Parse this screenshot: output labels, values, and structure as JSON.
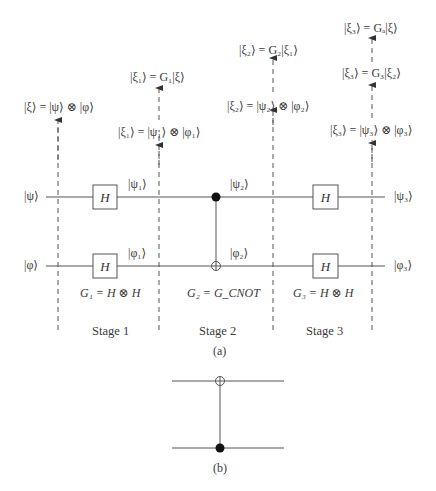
{
  "figure": {
    "part_a": {
      "caption": "(a)",
      "inputs": {
        "top": "|ψ⟩",
        "bottom": "|φ⟩"
      },
      "outputs": {
        "top": "|ψ₃⟩",
        "bottom": "|φ₃⟩"
      },
      "stages": [
        {
          "label": "Stage 1",
          "gate_formula": "G₁ = H ⊗ H",
          "gates": {
            "top": "H",
            "bottom": "H"
          },
          "wire_labels": {
            "top": "|ψ₁⟩",
            "bottom": "|φ₁⟩"
          }
        },
        {
          "label": "Stage 2",
          "gate_formula": "G₂ = G_CNOT",
          "gates": {
            "control": "top",
            "target": "bottom"
          },
          "wire_labels": {
            "top": "|ψ₂⟩",
            "bottom": "|φ₂⟩"
          }
        },
        {
          "label": "Stage 3",
          "gate_formula": "G₃ = H ⊗ H",
          "gates": {
            "top": "H",
            "bottom": "H"
          },
          "wire_labels": {
            "top": "|ψ₃⟩",
            "bottom": "|φ₃⟩"
          }
        }
      ],
      "state_annotations": {
        "stage0": [
          "|ξ⟩ = |ψ⟩ ⊗ |φ⟩"
        ],
        "stage1": [
          "|ξ₁⟩ = |ψ₁⟩ ⊗ |φ₁⟩",
          "|ξ₁⟩ = G₁|ξ⟩"
        ],
        "stage2": [
          "|ξ₂⟩ = |ψ₂⟩ ⊗ |φ₂⟩",
          "|ξ₂⟩ = G₂|ξ₁⟩"
        ],
        "stage3": [
          "|ξ₃⟩ = |ψ₃⟩ ⊗ |φ₃⟩",
          "|ξ₃⟩ = G₃|ξ₂⟩",
          "|ξ₃⟩ = Gₐ|ξ⟩"
        ]
      }
    },
    "part_b": {
      "caption": "(b)",
      "description": "CNOT with control on bottom wire, target on top wire"
    }
  }
}
